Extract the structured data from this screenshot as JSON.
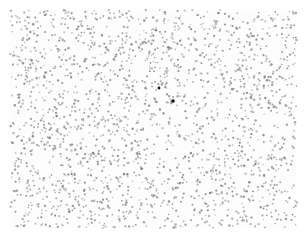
{
  "figure": {
    "width": 308,
    "height": 242,
    "background_color": "#ffffff",
    "title": "",
    "xlabel": "",
    "ylabel": ""
  },
  "plot_area": {
    "x_min_px": 10,
    "y_min_px": 10,
    "x_max_px": 297,
    "y_max_px": 228,
    "background_color": "#fdfdfd",
    "frame_visible": false,
    "grid": false,
    "ticks": false,
    "tick_labels": []
  },
  "markers": {
    "background_color": "#9a9a9a",
    "background_size_px": 1.9,
    "background_opacity": 0.85,
    "highlight_color": "#101010",
    "highlight_size_px": 3.2
  },
  "chart_data": {
    "type": "scatter",
    "title": "",
    "subtitle": "",
    "xlabel": "",
    "ylabel": "",
    "xlim": [
      0,
      1
    ],
    "ylim": [
      0,
      1
    ],
    "grid": false,
    "legend": null,
    "annotations": [],
    "series": [
      {
        "name": "background points",
        "role": "background",
        "color": "#9a9a9a",
        "marker": "circle",
        "marker_size_px": 1.9,
        "count": 2100,
        "distribution": "uniform-random-with-central-void",
        "void": {
          "center_x": 0.565,
          "center_y": 0.595,
          "radius": 0.155,
          "density_factor": 0.34
        },
        "seed": 20240917
      },
      {
        "name": "highlighted points",
        "role": "highlight",
        "color": "#101010",
        "marker": "circle",
        "count": 2,
        "points": [
          {
            "x_px": 159,
            "y_px": 88,
            "size_px": 2.8
          },
          {
            "x_px": 173,
            "y_px": 101,
            "size_px": 3.6
          }
        ]
      }
    ]
  }
}
